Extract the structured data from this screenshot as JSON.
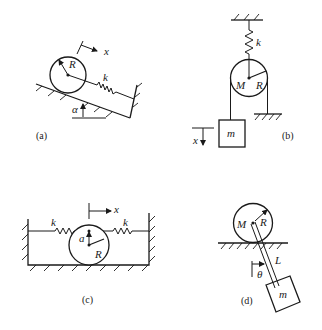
{
  "figures": {
    "a": {
      "caption": "(a)",
      "labels": {
        "radius": "R",
        "spring": "k",
        "coordinate": "x",
        "angle": "α"
      },
      "description": "Disk of radius R on an incline of angle α attached by spring k to a wall"
    },
    "b": {
      "caption": "(b)",
      "labels": {
        "spring": "k",
        "pulley_mass": "M",
        "radius": "R",
        "hanging_mass": "m",
        "coordinate": "x"
      },
      "description": "Pulley of mass M and radius R suspended by spring k, rope holding mass m, other end fixed to ground"
    },
    "c": {
      "caption": "(c)",
      "labels": {
        "spring_left": "k",
        "spring_right": "k",
        "coordinate": "x",
        "offset": "a",
        "radius": "R"
      },
      "description": "Disk of radius R between two walls connected by springs k at offset a above center"
    },
    "d": {
      "caption": "(d)",
      "labels": {
        "disk_mass": "M",
        "radius": "R",
        "rod_length": "L",
        "angle": "θ",
        "bob_mass": "m"
      },
      "description": "Disk of mass M rolling on ground with pendulum of length L and mass m attached at center"
    }
  }
}
